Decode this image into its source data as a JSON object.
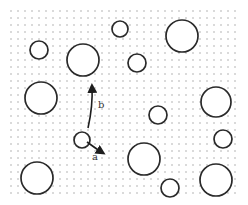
{
  "figure": {
    "colors": {
      "background": "#ffffff",
      "grid_dot": "#9a9a9a",
      "circle_stroke": "#2a2a2a",
      "arrow": "#1e1e1e",
      "label": "#333333"
    },
    "labels": {
      "arrow_a": "a",
      "arrow_b": "b"
    },
    "particle_count": 14
  }
}
